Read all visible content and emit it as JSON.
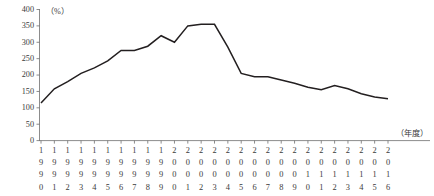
{
  "chart_data": {
    "type": "line",
    "title": "",
    "subtitle": "",
    "xlabel": "（年度）",
    "ylabel": "（%）",
    "unit_label": "（%）",
    "grid": false,
    "legend": null,
    "ylim": [
      0,
      400
    ],
    "ytick_step": 50,
    "yticks": [
      0,
      50,
      100,
      150,
      200,
      250,
      300,
      350,
      400
    ],
    "ytick_labels": [
      "0",
      "50",
      "100",
      "150",
      "200",
      "250",
      "300",
      "350",
      "400"
    ],
    "categories": [
      "1990",
      "1991",
      "1992",
      "1993",
      "1994",
      "1995",
      "1996",
      "1997",
      "1998",
      "1999",
      "2000",
      "2001",
      "2002",
      "2003",
      "2004",
      "2005",
      "2006",
      "2007",
      "2008",
      "2009",
      "2010",
      "2011",
      "2012",
      "2013",
      "2014",
      "2015",
      "2016"
    ],
    "values": [
      115,
      158,
      180,
      205,
      222,
      243,
      275,
      275,
      288,
      320,
      300,
      350,
      355,
      355,
      285,
      205,
      195,
      195,
      185,
      175,
      163,
      155,
      168,
      158,
      143,
      133,
      128
    ],
    "series": [
      {
        "name": "",
        "color": "#231f20",
        "values": [
          115,
          158,
          180,
          205,
          222,
          243,
          275,
          275,
          288,
          320,
          300,
          350,
          355,
          355,
          285,
          205,
          195,
          195,
          185,
          175,
          163,
          155,
          168,
          158,
          143,
          133,
          128
        ]
      }
    ],
    "annotations": []
  },
  "axes": {
    "y_unit_paren": "（%）",
    "x_unit_paren": "（年度）"
  }
}
